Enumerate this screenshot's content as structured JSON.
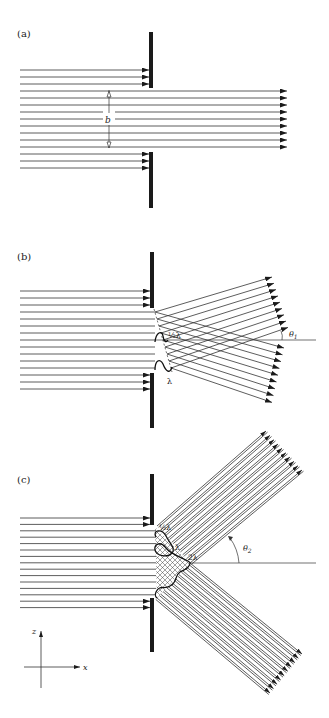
{
  "panels": [
    {
      "id": "a",
      "label": "(a)",
      "slit_label": "b",
      "description": "Plane wave through wide slit: rays pass straight"
    },
    {
      "id": "b",
      "label": "(b)",
      "half_lambda_label": "½λ",
      "lambda_label": "λ",
      "angle_label": "θ",
      "angle_sub": "1",
      "description": "First-order diffraction at angle theta 1"
    },
    {
      "id": "c",
      "label": "(c)",
      "half_lambda_label": "½λ",
      "lambda_label": "λ",
      "two_lambda_label": "2λ",
      "angle_label": "θ",
      "angle_sub": "2",
      "description": "Second-order diffraction at angle theta 2"
    }
  ],
  "axes": {
    "z_label": "z",
    "x_label": "x"
  },
  "colors": {
    "ink": "#1a1a1a",
    "line": "#333333",
    "background": "#ffffff"
  }
}
